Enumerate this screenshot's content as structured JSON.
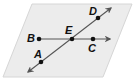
{
  "figure": {
    "type": "plane-with-intersecting-lines",
    "plane": {
      "fill": "#ececec",
      "stroke": "#d6d6d6",
      "points": [
        [
          32,
          4
        ],
        [
          132,
          4
        ],
        [
          103,
          77
        ],
        [
          3,
          77
        ]
      ]
    },
    "line_color": "#555555",
    "point_color": "#111111",
    "lines": [
      {
        "name": "line-BC",
        "through": [
          "B",
          "E",
          "C"
        ],
        "x1": 39,
        "y1": 39,
        "x2": 110,
        "y2": 39,
        "arrow_end": true,
        "arrow_start": false
      },
      {
        "name": "line-AD",
        "through": [
          "A",
          "E",
          "D"
        ],
        "x1": 28,
        "y1": 72,
        "x2": 111,
        "y2": 8,
        "arrow_end": true,
        "arrow_start": true
      }
    ],
    "points": [
      {
        "id": "B",
        "label": "B",
        "x": 39,
        "y": 39,
        "lx": 27,
        "ly": 42
      },
      {
        "id": "E",
        "label": "E",
        "x": 72,
        "y": 39,
        "lx": 65,
        "ly": 34
      },
      {
        "id": "C",
        "label": "C",
        "x": 93,
        "y": 39,
        "lx": 88,
        "ly": 52
      },
      {
        "id": "D",
        "label": "D",
        "x": 98,
        "y": 18,
        "lx": 89,
        "ly": 15
      },
      {
        "id": "A",
        "label": "A",
        "x": 41,
        "y": 62,
        "lx": 34,
        "ly": 58
      }
    ]
  },
  "labels": {
    "A": "A",
    "B": "B",
    "C": "C",
    "D": "D",
    "E": "E"
  }
}
